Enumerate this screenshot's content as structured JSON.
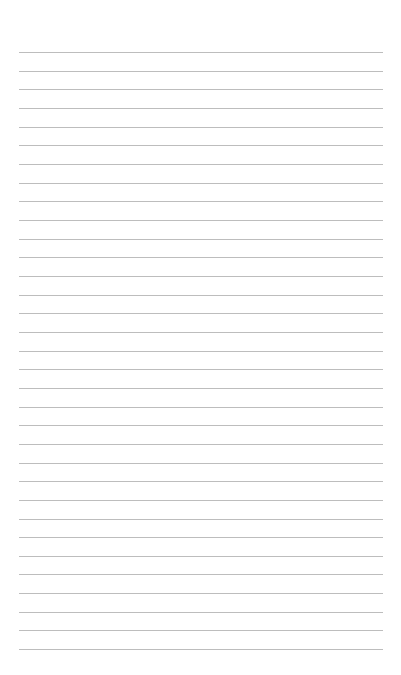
{
  "page": {
    "type": "lined-paper",
    "background_color": "#ffffff",
    "line_color": "#bdbdbd",
    "line_count": 33,
    "first_line_y": 52,
    "line_spacing": 18.66,
    "line_left": 19,
    "line_right": 383
  }
}
